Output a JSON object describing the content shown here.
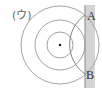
{
  "figure": {
    "label": "(ウ)",
    "points": {
      "a": "A",
      "b": "B"
    },
    "center": {
      "x": 60,
      "y": 45
    },
    "circle_radii": [
      13,
      25,
      39
    ],
    "wall": {
      "x": 85,
      "y": 5,
      "width": 10,
      "height": 83,
      "color": "#d4d4d4"
    },
    "arc": {
      "from": "A",
      "to": "B"
    },
    "stroke_color": "#999999"
  }
}
